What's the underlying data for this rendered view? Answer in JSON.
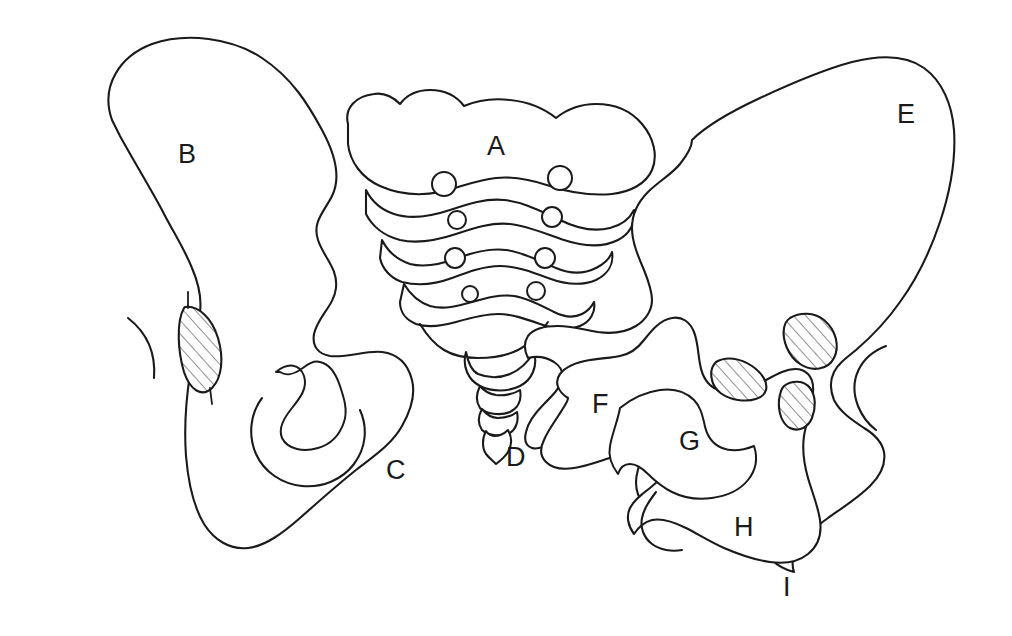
{
  "figure": {
    "background_color": "#ffffff",
    "stroke_color": "#1a1a1a",
    "hatch_color": "#555555",
    "width": 1012,
    "height": 636
  },
  "labels": [
    {
      "id": "A",
      "text": "A",
      "x": 487,
      "y": 133
    },
    {
      "id": "B",
      "text": "B",
      "x": 178,
      "y": 141
    },
    {
      "id": "C",
      "text": "C",
      "x": 386,
      "y": 457
    },
    {
      "id": "D",
      "text": "D",
      "x": 506,
      "y": 444
    },
    {
      "id": "E",
      "text": "E",
      "x": 897,
      "y": 101
    },
    {
      "id": "F",
      "text": "F",
      "x": 592,
      "y": 391
    },
    {
      "id": "G",
      "text": "G",
      "x": 679,
      "y": 428
    },
    {
      "id": "H",
      "text": "H",
      "x": 734,
      "y": 514
    },
    {
      "id": "I",
      "text": "I",
      "x": 783,
      "y": 574
    }
  ],
  "regions": [
    {
      "id": "A",
      "name": "sacrum",
      "label": "A"
    },
    {
      "id": "B",
      "name": "left-ilium",
      "label": "B"
    },
    {
      "id": "C",
      "name": "left-ischium",
      "label": "C"
    },
    {
      "id": "D",
      "name": "coccyx",
      "label": "D"
    },
    {
      "id": "E",
      "name": "right-ilium",
      "label": "E"
    },
    {
      "id": "F",
      "name": "superior-pubic-ramus",
      "label": "F"
    },
    {
      "id": "G",
      "name": "obturator-foramen",
      "label": "G"
    },
    {
      "id": "H",
      "name": "ischium",
      "label": "H"
    },
    {
      "id": "I",
      "name": "ischial-tuberosity",
      "label": "I"
    }
  ],
  "hatched_regions": [
    {
      "id": "left-sacroiliac-joint",
      "name": "left-sacroiliac-joint"
    },
    {
      "id": "right-pubic-symphysis",
      "name": "pubic-symphysis"
    },
    {
      "id": "right-sacroiliac-joint",
      "name": "right-sacroiliac-joint"
    },
    {
      "id": "right-lower-joint",
      "name": "right-lower-joint"
    }
  ],
  "arcs": [
    {
      "id": "left-femoral-head-arc",
      "name": "left-femoral-head-arc"
    },
    {
      "id": "right-femoral-head-arc",
      "name": "right-femoral-head-arc"
    }
  ]
}
